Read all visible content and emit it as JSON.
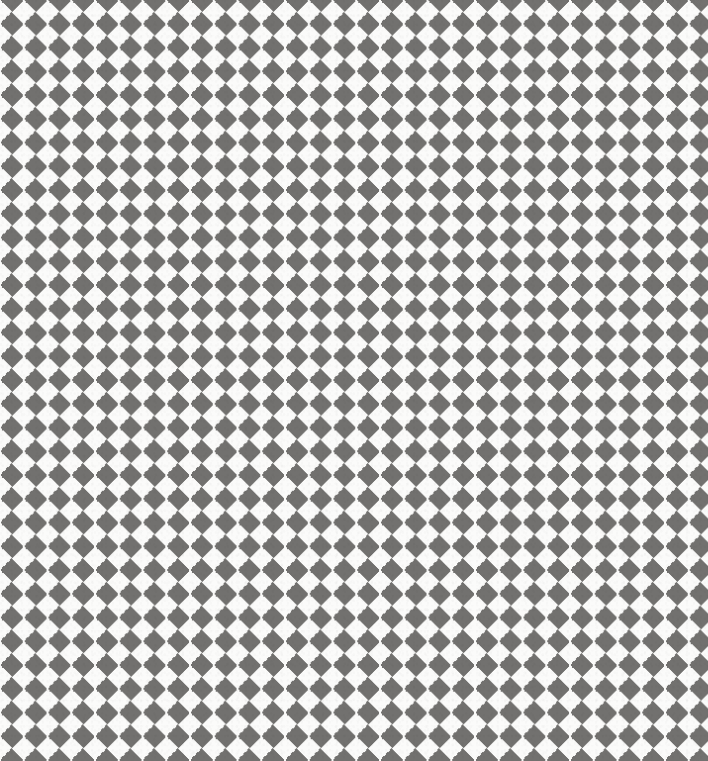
{
  "image": {
    "kind": "geometric-pattern",
    "subject": "diagonal-checkerboard",
    "alt_names": [
      "harlequin-diamond-pattern",
      "argyle-check",
      "rotated-checkerboard"
    ],
    "width_px": 708,
    "height_px": 761,
    "medium": "scanned-paper-print",
    "caption": ""
  },
  "pattern": {
    "motif": "diamond",
    "description": "Alternating gray and white diamonds (squares rotated 45 degrees) tiling the full frame edge to edge.",
    "lattice_period_px": 47.5,
    "half_period_px": 23.75,
    "diamond_diagonal_horizontal_px": 47.5,
    "diamond_diagonal_vertical_px": 47.5,
    "rotation_deg": 45,
    "columns_visible": 15,
    "rows_visible": 16,
    "origin_parity": "gray diamond centered at (0,0)",
    "top_edge_appearance": "row of downward-pointing gray triangles",
    "left_edge_appearance": "column of alternating gray and white half-diamonds",
    "bottom_edge_appearance": "white diamond points meeting the lower border",
    "edge_bleed": "pattern is cropped by the frame on all four sides"
  },
  "colors": {
    "diamond_dark": "#72716f",
    "diamond_light": "#fbfbfa",
    "paper_white": "#ffffff",
    "grain_tint": "#000000",
    "dark_label": "warm gray",
    "light_label": "off white"
  },
  "texture": {
    "grain": "fine paper speckle",
    "grain_opacity": 0.3,
    "vignette": "subtle light falloff at outer edges",
    "edge_softness_px": 0.35
  }
}
